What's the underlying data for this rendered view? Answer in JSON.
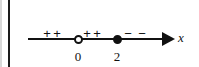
{
  "figure": {
    "type": "number-line-sign-chart",
    "axis_label": "x",
    "axis": {
      "label": "x",
      "arrow_direction": "right",
      "line_start_px": 28,
      "line_end_px": 172,
      "baseline_y_px": 39
    },
    "points": [
      {
        "label": "0",
        "value": 0,
        "marker": "open-circle",
        "x_px": 78,
        "included": false
      },
      {
        "label": "2",
        "value": 2,
        "marker": "closed-circle",
        "x_px": 117,
        "included": true
      }
    ],
    "sign_marks": [
      {
        "symbol": "+",
        "x_px": 47
      },
      {
        "symbol": "+",
        "x_px": 57
      },
      {
        "symbol": "+",
        "x_px": 87
      },
      {
        "symbol": "+",
        "x_px": 97
      },
      {
        "symbol": "−",
        "x_px": 128
      },
      {
        "symbol": "−",
        "x_px": 142
      }
    ],
    "intervals": [
      {
        "range": "(-∞, 0)",
        "sign": "+"
      },
      {
        "range": "(0, 2)",
        "sign": "+"
      },
      {
        "range": "(2, ∞)",
        "sign": "−"
      }
    ],
    "colors": {
      "background": "#ffffff",
      "ink": "#111111",
      "margin_rule": "#1b1b1b",
      "edge_rule": "#d8d8d8"
    }
  }
}
